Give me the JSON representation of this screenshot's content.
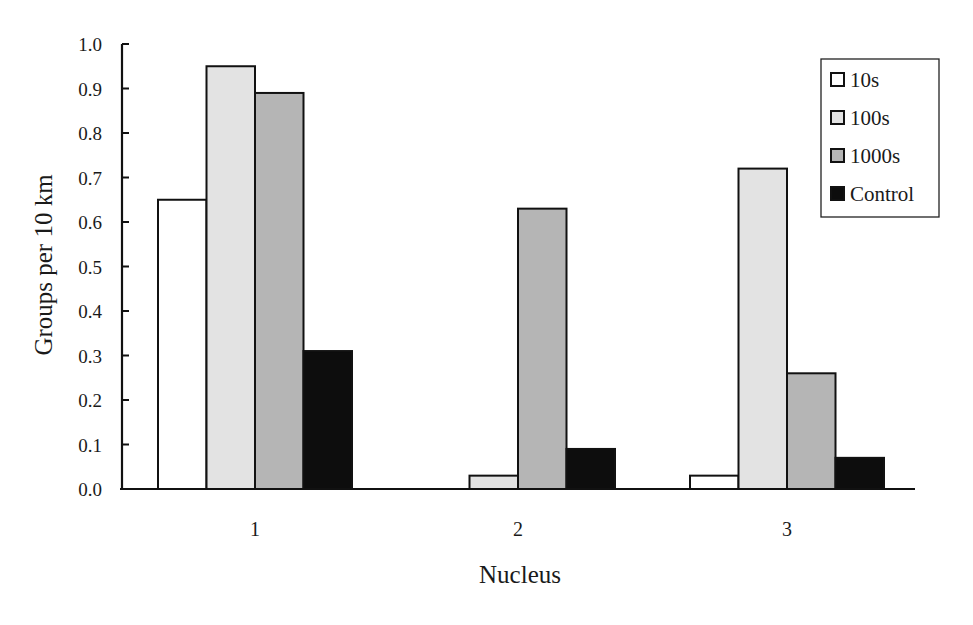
{
  "chart_data": {
    "type": "bar",
    "title": "",
    "xlabel": "Nucleus",
    "ylabel": "Groups per 10 km",
    "categories": [
      "1",
      "2",
      "3"
    ],
    "series": [
      {
        "name": "10s",
        "color": "#ffffff",
        "values": [
          0.65,
          0.0,
          0.03
        ]
      },
      {
        "name": "100s",
        "color": "#e3e3e3",
        "values": [
          0.95,
          0.03,
          0.72
        ]
      },
      {
        "name": "1000s",
        "color": "#b5b5b5",
        "values": [
          0.89,
          0.63,
          0.26
        ]
      },
      {
        "name": "Control",
        "color": "#0d0d0d",
        "values": [
          0.31,
          0.09,
          0.07
        ]
      }
    ],
    "ylim": [
      0,
      1.0
    ],
    "yticks": [
      "0.0",
      "0.1",
      "0.2",
      "0.3",
      "0.4",
      "0.5",
      "0.6",
      "0.7",
      "0.8",
      "0.9",
      "1.0"
    ],
    "grid": false,
    "legend_position": "upper right"
  }
}
